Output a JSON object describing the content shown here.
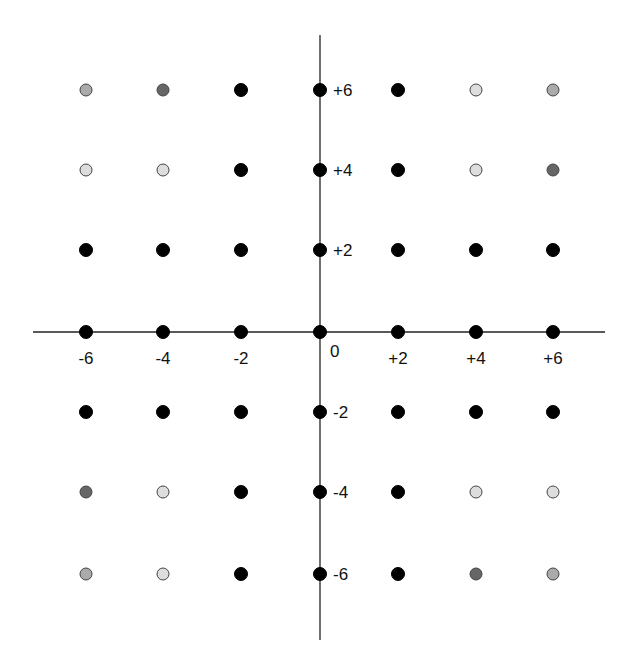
{
  "diagram": {
    "title": "",
    "axes": {
      "x_axis": {
        "x1": 33,
        "x2": 605,
        "y": 332
      },
      "y_axis": {
        "x": 320,
        "y1": 35,
        "y2": 640
      },
      "origin_label": "0"
    },
    "x_tick_labels": [
      "-6",
      "-4",
      "-2",
      "+2",
      "+4",
      "+6"
    ],
    "y_tick_labels": [
      "+6",
      "+4",
      "+2",
      "-2",
      "-4",
      "-6"
    ],
    "colors": {
      "black": "#000000",
      "dark": "#666666",
      "mid": "#aaaaaa",
      "light": "#dddddd",
      "outline": "#444444",
      "axis": "#222222"
    }
  },
  "chart_data": {
    "type": "scatter",
    "title": "",
    "xlabel": "",
    "ylabel": "",
    "x_values": [
      -6,
      -4,
      -2,
      0,
      2,
      4,
      6
    ],
    "y_values": [
      6,
      4,
      2,
      0,
      -2,
      -4,
      -6
    ],
    "xlim": [
      -7,
      7
    ],
    "ylim": [
      -7,
      7
    ],
    "grid": false,
    "legend": null,
    "shade_legend": {
      "black": "black",
      "dark": "dark gray",
      "mid": "medium gray",
      "light": "light gray"
    },
    "points": [
      {
        "y": 6,
        "shades": [
          "mid",
          "dark",
          "black",
          "black",
          "black",
          "light",
          "mid"
        ]
      },
      {
        "y": 4,
        "shades": [
          "light",
          "light",
          "black",
          "black",
          "black",
          "light",
          "dark"
        ]
      },
      {
        "y": 2,
        "shades": [
          "black",
          "black",
          "black",
          "black",
          "black",
          "black",
          "black"
        ]
      },
      {
        "y": 0,
        "shades": [
          "black",
          "black",
          "black",
          "black",
          "black",
          "black",
          "black"
        ]
      },
      {
        "y": -2,
        "shades": [
          "black",
          "black",
          "black",
          "black",
          "black",
          "black",
          "black"
        ]
      },
      {
        "y": -4,
        "shades": [
          "dark",
          "light",
          "black",
          "black",
          "black",
          "light",
          "light"
        ]
      },
      {
        "y": -6,
        "shades": [
          "mid",
          "light",
          "black",
          "black",
          "black",
          "dark",
          "mid"
        ]
      }
    ]
  }
}
